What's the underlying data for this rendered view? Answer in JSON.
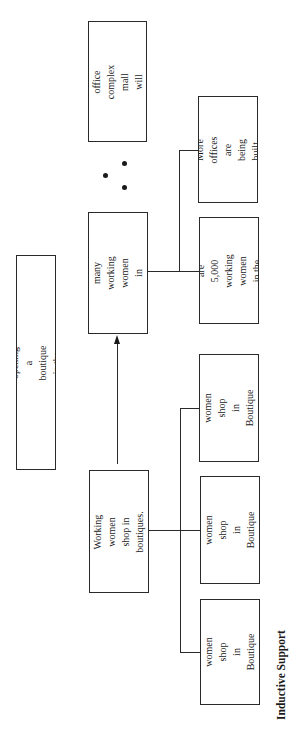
{
  "diagram": {
    "orientation": "rotated-90-ccw",
    "title": "Inductive Support",
    "nodes": {
      "main_claim": {
        "label": "We should consider opening a\nboutique in the office complex mall."
      },
      "premise_attract": {
        "label": "A boutique in the\noffice complex mall\nwill attract\nworking women."
      },
      "premise_many": {
        "label": "There will be many\nworking women in\nthe area complex."
      },
      "support_5000": {
        "label": "There are\n5,000 working\nwomen in the\ncomplex."
      },
      "support_offices": {
        "label": "More offices\nare being built."
      },
      "generalization": {
        "label": "Working women\nshop in boutiques."
      },
      "boutique_a": {
        "label": "Working\nwomen shop\nin Boutique A."
      },
      "boutique_b": {
        "label": "Working\nwomen shop\nin Boutique B."
      },
      "boutique_c": {
        "label": "Working\nwomen shop\nin Boutique C."
      }
    },
    "connections": [
      {
        "from": "support_5000",
        "to": "premise_many",
        "type": "bracket"
      },
      {
        "from": "support_offices",
        "to": "premise_many",
        "type": "bracket"
      },
      {
        "from": "boutique_a",
        "to": "generalization",
        "type": "bracket"
      },
      {
        "from": "boutique_b",
        "to": "generalization",
        "type": "bracket"
      },
      {
        "from": "boutique_c",
        "to": "generalization",
        "type": "bracket"
      },
      {
        "from": "generalization",
        "to": "premise_many",
        "type": "arrow"
      }
    ],
    "therefore_symbol": "∴",
    "colors": {
      "stroke": "#2a2a2a",
      "text": "#1a1a1a",
      "background": "#ffffff"
    }
  }
}
